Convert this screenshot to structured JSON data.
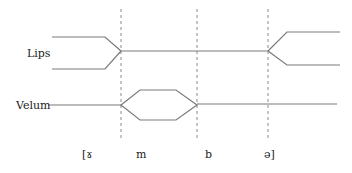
{
  "diagram": {
    "type": "articulatory-gestural-score",
    "tiers": [
      {
        "label": "Lips"
      },
      {
        "label": "Velum"
      }
    ],
    "segments": [
      {
        "label": "[ɤ"
      },
      {
        "label": "m"
      },
      {
        "label": "b"
      },
      {
        "label": "ə]"
      }
    ],
    "colors": {
      "line": "#7a7a7a",
      "dashed": "#8a8a8a",
      "text": "#222222",
      "background": "#ffffff"
    }
  }
}
